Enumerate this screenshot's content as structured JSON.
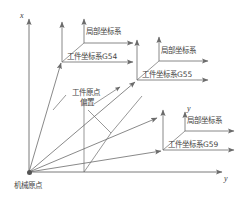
{
  "figure": {
    "kind": "cnc-coordinate-offset-diagram",
    "line_color": "#6b6b6b",
    "text_color": "#444444",
    "background": "#ffffff"
  },
  "axes": {
    "vertical_label": "x",
    "horizontal_label": "y"
  },
  "machine": {
    "origin_label": "机械原点"
  },
  "offset_annotation": {
    "line1": "工件原点",
    "line2": "偏置"
  },
  "systems": [
    {
      "id": "g54",
      "workpiece_label": "工件坐标系G54",
      "local_label": "局部坐标系",
      "workpiece_origin": {
        "x": 62,
        "y": 62
      },
      "local_origin": {
        "x": 84,
        "y": 43
      }
    },
    {
      "id": "g55",
      "workpiece_label": "工件坐标系G55",
      "local_label": "局部坐标系",
      "workpiece_origin": {
        "x": 137,
        "y": 80
      },
      "local_origin": {
        "x": 159,
        "y": 61
      }
    },
    {
      "id": "g59",
      "workpiece_label": "工件坐标系G59",
      "local_label": "局部坐标系",
      "workpiece_origin": {
        "x": 163,
        "y": 150
      },
      "local_origin": {
        "x": 185,
        "y": 131
      },
      "local_axis_label": "y"
    }
  ]
}
